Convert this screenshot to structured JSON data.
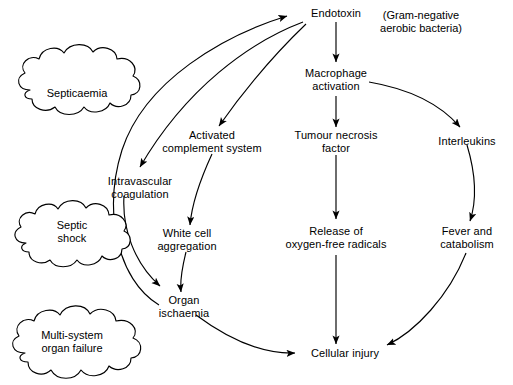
{
  "diagram": {
    "caption": {
      "line1": "(Gram-negative",
      "line2": "aerobic bacteria)"
    },
    "clouds": [
      {
        "id": "septicaemia",
        "line1": "Septicaemia",
        "line2": ""
      },
      {
        "id": "septic-shock",
        "line1": "Septic",
        "line2": "shock"
      },
      {
        "id": "multi-system-organ-failure",
        "line1": "Multi-system",
        "line2": "organ failure"
      }
    ],
    "nodes": [
      {
        "id": "endotoxin",
        "line1": "Endotoxin",
        "line2": ""
      },
      {
        "id": "macrophage-activation",
        "line1": "Macrophage",
        "line2": "activation"
      },
      {
        "id": "activated-complement-system",
        "line1": "Activated",
        "line2": "complement system"
      },
      {
        "id": "tumour-necrosis-factor",
        "line1": "Tumour necrosis",
        "line2": "factor"
      },
      {
        "id": "interleukins",
        "line1": "Interleukins",
        "line2": ""
      },
      {
        "id": "intravascular-coagulation",
        "line1": "Intravascular",
        "line2": "coagulation"
      },
      {
        "id": "white-cell-aggregation",
        "line1": "White cell",
        "line2": "aggregation"
      },
      {
        "id": "release-of-oxygen-free-radicals",
        "line1": "Release of",
        "line2": "oxygen-free radicals"
      },
      {
        "id": "fever-and-catabolism",
        "line1": "Fever and",
        "line2": "catabolism"
      },
      {
        "id": "organ-ischaemia",
        "line1": "Organ",
        "line2": "ischaemia"
      },
      {
        "id": "cellular-injury",
        "line1": "Cellular injury",
        "line2": ""
      }
    ],
    "edges": [
      {
        "from": "organ-ischaemia-region",
        "to": "endotoxin",
        "style": "curved"
      },
      {
        "from": "endotoxin",
        "to": "intravascular-coagulation",
        "style": "curved"
      },
      {
        "from": "endotoxin",
        "to": "activated-complement-system",
        "style": "curved"
      },
      {
        "from": "endotoxin",
        "to": "macrophage-activation",
        "style": "straight"
      },
      {
        "from": "macrophage-activation",
        "to": "tumour-necrosis-factor",
        "style": "straight"
      },
      {
        "from": "macrophage-activation",
        "to": "interleukins",
        "style": "curved"
      },
      {
        "from": "activated-complement-system",
        "to": "white-cell-aggregation",
        "style": "curved"
      },
      {
        "from": "tumour-necrosis-factor",
        "to": "release-of-oxygen-free-radicals",
        "style": "straight"
      },
      {
        "from": "interleukins",
        "to": "fever-and-catabolism",
        "style": "curved"
      },
      {
        "from": "intravascular-coagulation",
        "to": "organ-ischaemia",
        "style": "curved"
      },
      {
        "from": "white-cell-aggregation",
        "to": "organ-ischaemia",
        "style": "curved"
      },
      {
        "from": "organ-ischaemia",
        "to": "cellular-injury",
        "style": "curved"
      },
      {
        "from": "release-of-oxygen-free-radicals",
        "to": "cellular-injury",
        "style": "straight"
      },
      {
        "from": "fever-and-catabolism",
        "to": "cellular-injury",
        "style": "curved"
      }
    ],
    "colors": {
      "stroke": "#000000",
      "text": "#000000",
      "background": "#ffffff"
    }
  }
}
